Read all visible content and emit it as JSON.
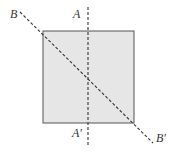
{
  "diagram": {
    "type": "geometry",
    "colors": {
      "fill": "#e6e6e6",
      "stroke": "#555555",
      "dash": "#333333"
    },
    "square": {
      "x": 43,
      "y": 31,
      "width": 91,
      "height": 92
    },
    "lines": [
      {
        "id": "AA'",
        "x1": 88,
        "y1": 7,
        "x2": 88,
        "y2": 147
      },
      {
        "id": "BB'",
        "x1": 20,
        "y1": 12,
        "x2": 153,
        "y2": 143
      }
    ],
    "labels": {
      "A": "A",
      "A_prime": "A′",
      "B": "B",
      "B_prime": "B′"
    }
  }
}
